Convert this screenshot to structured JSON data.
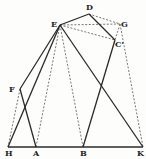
{
  "diagram": {
    "points": {
      "D": {
        "label": "D",
        "x": 89,
        "y": 14,
        "lx": 86,
        "ly": 10
      },
      "E": {
        "label": "E",
        "x": 60,
        "y": 25,
        "lx": 51,
        "ly": 27
      },
      "G": {
        "label": "G",
        "x": 120,
        "y": 24,
        "lx": 121,
        "ly": 27
      },
      "C": {
        "label": "C'",
        "x": 115,
        "y": 40,
        "lx": 115,
        "ly": 47
      },
      "F": {
        "label": "F",
        "x": 20,
        "y": 89,
        "lx": 9,
        "ly": 92
      },
      "H": {
        "label": "H",
        "x": 8,
        "y": 147,
        "lx": 5,
        "ly": 156
      },
      "A": {
        "label": "A",
        "x": 36,
        "y": 147,
        "lx": 33,
        "ly": 156
      },
      "B": {
        "label": "B",
        "x": 83,
        "y": 147,
        "lx": 80,
        "ly": 156
      },
      "K": {
        "label": "K",
        "x": 143,
        "y": 147,
        "lx": 137,
        "ly": 156
      }
    },
    "solid_segments": [
      [
        "E",
        "D"
      ],
      [
        "D",
        "C"
      ],
      [
        "C",
        "B"
      ],
      [
        "E",
        "K"
      ],
      [
        "E",
        "F"
      ],
      [
        "E",
        "H"
      ],
      [
        "F",
        "A"
      ],
      [
        "H",
        "K"
      ]
    ],
    "dashed_segments": [
      [
        "D",
        "G"
      ],
      [
        "E",
        "G"
      ],
      [
        "E",
        "C"
      ],
      [
        "G",
        "C"
      ],
      [
        "G",
        "K"
      ],
      [
        "E",
        "B"
      ],
      [
        "E",
        "A"
      ],
      [
        "F",
        "H"
      ]
    ]
  }
}
